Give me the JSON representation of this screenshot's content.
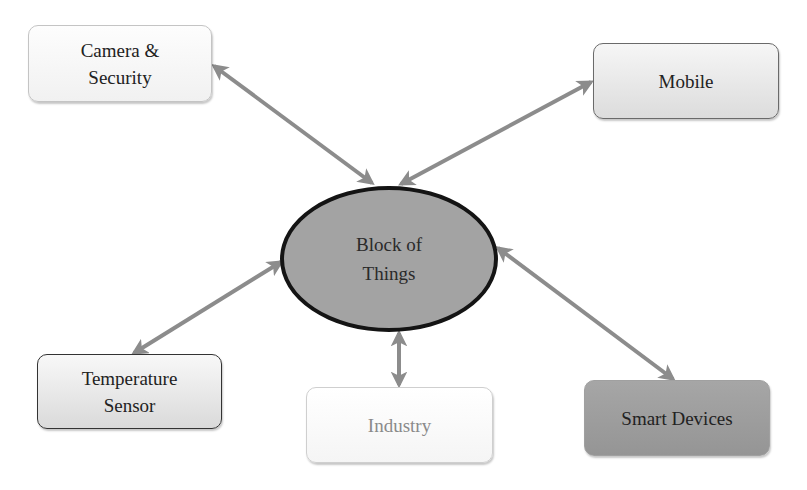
{
  "diagram": {
    "type": "hub-and-spoke",
    "center": {
      "line1": "Block of",
      "line2": "Things",
      "fill": "#a3a3a3",
      "border": "#141414"
    },
    "nodes": [
      {
        "id": "camera",
        "line1": "Camera &",
        "line2": "Security",
        "fill": "#f7f7f7",
        "border": "#c4c4c4"
      },
      {
        "id": "mobile",
        "line1": "Mobile",
        "fill": "#e8e8e8",
        "border": "#6a6a6a"
      },
      {
        "id": "temperature",
        "line1": "Temperature",
        "line2": "Sensor",
        "fill": "#e8e8e8",
        "border": "#333333"
      },
      {
        "id": "industry",
        "line1": "Industry",
        "fill": "#fafafa",
        "border": "#cfcfcf",
        "text_color": "#8a8a8a"
      },
      {
        "id": "smart",
        "line1": "Smart Devices",
        "fill": "#9e9e9e",
        "border": "#a0a0a0"
      }
    ],
    "edges": [
      {
        "from": "center",
        "to": "camera",
        "style": "double-arrow"
      },
      {
        "from": "center",
        "to": "mobile",
        "style": "double-arrow"
      },
      {
        "from": "center",
        "to": "temperature",
        "style": "double-arrow"
      },
      {
        "from": "center",
        "to": "industry",
        "style": "double-arrow"
      },
      {
        "from": "center",
        "to": "smart",
        "style": "double-arrow"
      }
    ],
    "arrow_color": "#8c8c8c"
  }
}
